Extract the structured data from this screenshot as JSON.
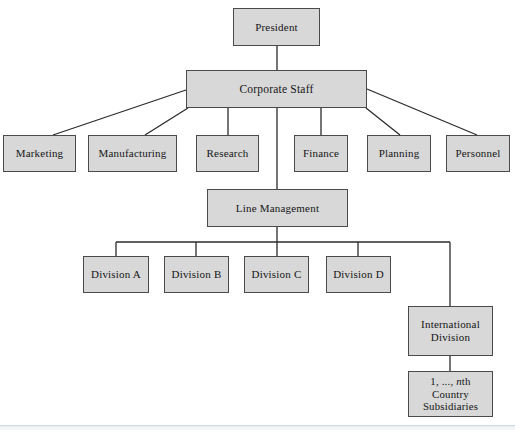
{
  "diagram": {
    "type": "org-chart",
    "background": "#ffffff",
    "box_fill": "#d8d8d8",
    "box_border": "#4a4a4a",
    "connector_color": "#2b2b2b",
    "text_color": "#151515",
    "bottom_rule_color": "#d0dae2"
  },
  "nodes": {
    "president": {
      "label": "President"
    },
    "corporate_staff": {
      "label": "Corporate Staff"
    },
    "marketing": {
      "label": "Marketing"
    },
    "manufacturing": {
      "label": "Manufacturing"
    },
    "research": {
      "label": "Research"
    },
    "finance": {
      "label": "Finance"
    },
    "planning": {
      "label": "Planning"
    },
    "personnel": {
      "label": "Personnel"
    },
    "line_management": {
      "label": "Line Management"
    },
    "division_a": {
      "label": "Division A"
    },
    "division_b": {
      "label": "Division B"
    },
    "division_c": {
      "label": "Division C"
    },
    "division_d": {
      "label": "Division D"
    },
    "international_division": {
      "label": "International Division"
    },
    "country_subsidiaries": {
      "line1_prefix": "1, ..., ",
      "line1_italic": "n",
      "line1_suffix": "th",
      "line2": "Country",
      "line3": "Subsidiaries"
    }
  },
  "hierarchy": [
    {
      "parent": "President",
      "child": "Corporate Staff"
    },
    {
      "parent": "Corporate Staff",
      "child": "Marketing"
    },
    {
      "parent": "Corporate Staff",
      "child": "Manufacturing"
    },
    {
      "parent": "Corporate Staff",
      "child": "Research"
    },
    {
      "parent": "Corporate Staff",
      "child": "Finance"
    },
    {
      "parent": "Corporate Staff",
      "child": "Planning"
    },
    {
      "parent": "Corporate Staff",
      "child": "Personnel"
    },
    {
      "parent": "Corporate Staff",
      "child": "Line Management"
    },
    {
      "parent": "Line Management",
      "child": "Division A"
    },
    {
      "parent": "Line Management",
      "child": "Division B"
    },
    {
      "parent": "Line Management",
      "child": "Division C"
    },
    {
      "parent": "Line Management",
      "child": "Division D"
    },
    {
      "parent": "Line Management",
      "child": "International Division"
    },
    {
      "parent": "International Division",
      "child": "1, ..., nth Country Subsidiaries"
    }
  ]
}
